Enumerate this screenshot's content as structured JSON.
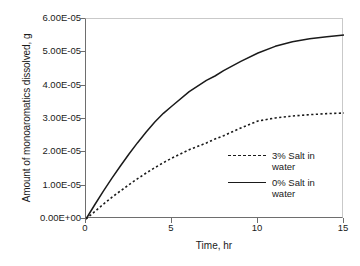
{
  "chart_data": {
    "type": "line",
    "title": "",
    "xlabel": "Time, hr",
    "ylabel": "Amount of monoaromatics dissolved, g",
    "xlim": [
      0,
      15
    ],
    "ylim": [
      0,
      6e-05
    ],
    "grid": false,
    "legend_position": "center-right inside axes",
    "xticks": [
      "0",
      "5",
      "10",
      "15"
    ],
    "xtick_values": [
      0,
      5,
      10,
      15
    ],
    "yticks": [
      "0.00E+00",
      "1.00E-05",
      "2.00E-05",
      "3.00E-05",
      "4.00E-05",
      "5.00E-05",
      "6.00E-05"
    ],
    "ytick_values": [
      0,
      1e-05,
      2e-05,
      3e-05,
      4e-05,
      5e-05,
      6e-05
    ],
    "x": [
      0,
      0.5,
      1,
      1.5,
      2,
      2.5,
      3,
      3.5,
      4,
      4.5,
      5,
      6,
      7,
      7.5,
      8,
      9,
      10,
      11,
      12,
      13,
      14,
      15
    ],
    "series": [
      {
        "name": "3% Salt in water",
        "style": "dashed",
        "color": "#1a1a1a",
        "values": [
          0.0,
          2.2e-06,
          4.4e-06,
          6.5e-06,
          8.4e-06,
          1.03e-05,
          1.21e-05,
          1.38e-05,
          1.54e-05,
          1.69e-05,
          1.83e-05,
          2.08e-05,
          2.28e-05,
          2.4e-05,
          2.5e-05,
          2.73e-05,
          2.94e-05,
          3.03e-05,
          3.09e-05,
          3.13e-05,
          3.16e-05,
          3.18e-05
        ]
      },
      {
        "name": "0% Salt in water",
        "style": "solid",
        "color": "#1a1a1a",
        "values": [
          0.0,
          4.2e-06,
          8.3e-06,
          1.22e-05,
          1.59e-05,
          1.95e-05,
          2.29e-05,
          2.61e-05,
          2.91e-05,
          3.17e-05,
          3.39e-05,
          3.82e-05,
          4.16e-05,
          4.29e-05,
          4.45e-05,
          4.73e-05,
          4.98e-05,
          5.18e-05,
          5.32e-05,
          5.41e-05,
          5.47e-05,
          5.52e-05
        ]
      }
    ]
  },
  "legend": {
    "entries": [
      {
        "label": "3% Salt in\nwater",
        "style": "dashed"
      },
      {
        "label": "0% Salt in\nwater",
        "style": "solid"
      }
    ]
  },
  "colors": {
    "line": "#1a1a1a",
    "axis": "#6e6e6e",
    "frame": "#c9c9c9",
    "background": "#ffffff"
  }
}
